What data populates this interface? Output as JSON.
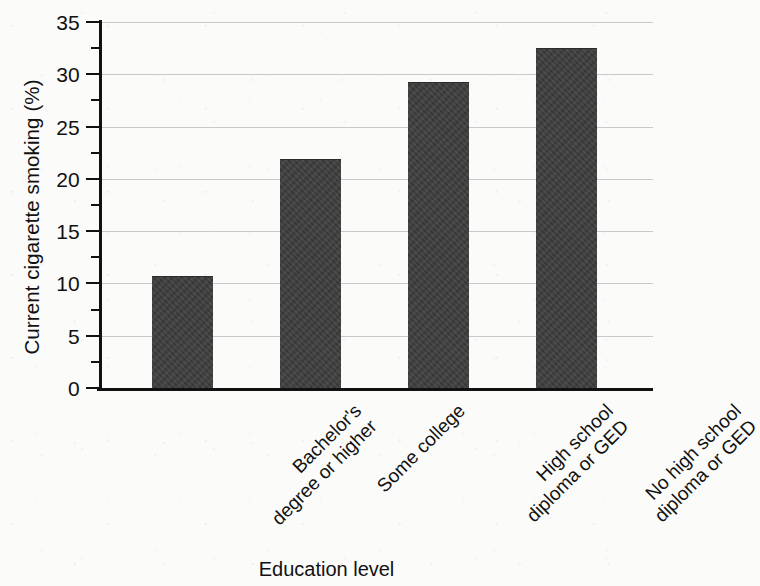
{
  "chart_data": {
    "type": "bar",
    "title": "",
    "subtitle": "",
    "xlabel": "Education level",
    "ylabel": "Current cigarette smoking (%)",
    "categories": [
      "Bachelor's degree or higher",
      "Some college",
      "High school diploma or GED",
      "No high school diploma or GED"
    ],
    "category_lines": [
      [
        "Bachelor's",
        "degree or higher"
      ],
      [
        "Some college"
      ],
      [
        "High school",
        "diploma or GED"
      ],
      [
        "No high school",
        "diploma or GED"
      ]
    ],
    "values": [
      10.6,
      21.8,
      29.2,
      32.4
    ],
    "ylim": [
      0,
      35
    ],
    "ytick_labels": [
      "0",
      "5",
      "10",
      "15",
      "20",
      "25",
      "30",
      "35"
    ],
    "ytick_values": [
      0,
      5,
      10,
      15,
      20,
      25,
      30,
      35
    ],
    "yminor_tick_values": [
      2.5,
      7.5,
      12.5,
      17.5,
      22.5,
      27.5,
      32.5
    ],
    "grid": true,
    "grid_axis": "y",
    "legend": false,
    "bar_color": "#3d3d3d",
    "axis_color": "#111111",
    "grid_color": "#c9c9c9",
    "background_color": "#fbfbfa",
    "label_rotation": -45
  }
}
